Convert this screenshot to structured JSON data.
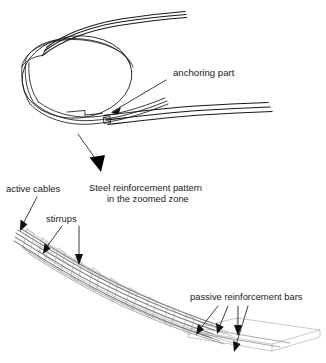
{
  "figure": {
    "background_color": "#ffffff",
    "line_color": "#1a1a1a",
    "mesh_color": "#9a9a9a",
    "width": 326,
    "height": 363
  },
  "labels": {
    "anchoring_part": "anchoring part",
    "zoom_caption_line1": "Steel reinforcement pattern",
    "zoom_caption_line2": "in the zoomed zone",
    "active_cables": "active cables",
    "stirrups": "stirrups",
    "passive_reinforcement_bars": "passive reinforcement bars"
  },
  "annotations": {
    "anchoring_part_arrow": "arrow-pointing-down-left",
    "zoom_arrow": "large-solid-arrow-pointing-down-right",
    "active_cables_arrow": "arrow-pointing-down-left",
    "stirrups_arrows": [
      "arrow-pointing-down-left",
      "arrow-pointing-down"
    ],
    "passive_bars_arrows": [
      "arrow-pointing-down-left",
      "arrow-pointing-down-left",
      "arrow-pointing-down"
    ]
  },
  "views": {
    "top_view_name": "curved ring beam perspective with anchoring zone",
    "bottom_view_name": "zoomed wireframe of reinforcement cage"
  }
}
